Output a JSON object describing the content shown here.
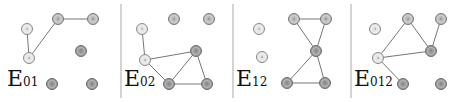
{
  "figure": {
    "panels": [
      {
        "label_main": "E",
        "label_sub": "01",
        "nodes": [
          {
            "id": "3",
            "x": 27,
            "y": 29,
            "shade": "light"
          },
          {
            "id": "2",
            "x": 58,
            "y": 19,
            "shade": "mid"
          },
          {
            "id": "6",
            "x": 93,
            "y": 19,
            "shade": "mid"
          },
          {
            "id": "4",
            "x": 29,
            "y": 58,
            "shade": "light"
          },
          {
            "id": "7",
            "x": 81,
            "y": 51,
            "shade": "dark"
          },
          {
            "id": "1",
            "x": 52,
            "y": 84,
            "shade": "dark"
          },
          {
            "id": "5",
            "x": 92,
            "y": 84,
            "shade": "dark"
          }
        ],
        "edges": [
          [
            "3",
            "4"
          ],
          [
            "4",
            "2"
          ],
          [
            "2",
            "6"
          ]
        ]
      },
      {
        "label_main": "E",
        "label_sub": "02",
        "nodes": [
          {
            "id": "3",
            "x": 142,
            "y": 29,
            "shade": "light"
          },
          {
            "id": "2",
            "x": 174,
            "y": 19,
            "shade": "mid"
          },
          {
            "id": "6",
            "x": 209,
            "y": 19,
            "shade": "mid"
          },
          {
            "id": "4",
            "x": 145,
            "y": 60,
            "shade": "light"
          },
          {
            "id": "7",
            "x": 196,
            "y": 51,
            "shade": "dark"
          },
          {
            "id": "1",
            "x": 169,
            "y": 84,
            "shade": "dark"
          },
          {
            "id": "5",
            "x": 207,
            "y": 84,
            "shade": "dark"
          }
        ],
        "edges": [
          [
            "3",
            "4"
          ],
          [
            "4",
            "7"
          ],
          [
            "4",
            "1"
          ],
          [
            "1",
            "7"
          ],
          [
            "7",
            "5"
          ],
          [
            "1",
            "5"
          ]
        ]
      },
      {
        "label_main": "E",
        "label_sub": "12",
        "nodes": [
          {
            "id": "3",
            "x": 259,
            "y": 29,
            "shade": "light"
          },
          {
            "id": "4",
            "x": 262,
            "y": 57,
            "shade": "light"
          },
          {
            "id": "2",
            "x": 294,
            "y": 19,
            "shade": "mid"
          },
          {
            "id": "6",
            "x": 326,
            "y": 19,
            "shade": "mid"
          },
          {
            "id": "7",
            "x": 316,
            "y": 51,
            "shade": "dark"
          },
          {
            "id": "1",
            "x": 287,
            "y": 83,
            "shade": "dark"
          },
          {
            "id": "5",
            "x": 325,
            "y": 83,
            "shade": "dark"
          }
        ],
        "edges": [
          [
            "2",
            "6"
          ],
          [
            "2",
            "7"
          ],
          [
            "6",
            "7"
          ],
          [
            "7",
            "1"
          ],
          [
            "7",
            "5"
          ],
          [
            "1",
            "5"
          ]
        ]
      },
      {
        "label_main": "E",
        "label_sub": "012",
        "nodes": [
          {
            "id": "3",
            "x": 375,
            "y": 29,
            "shade": "light"
          },
          {
            "id": "2",
            "x": 408,
            "y": 19,
            "shade": "mid"
          },
          {
            "id": "6",
            "x": 441,
            "y": 19,
            "shade": "mid"
          },
          {
            "id": "4",
            "x": 378,
            "y": 58,
            "shade": "light"
          },
          {
            "id": "7",
            "x": 431,
            "y": 51,
            "shade": "dark"
          },
          {
            "id": "1",
            "x": 403,
            "y": 84,
            "shade": "dark"
          },
          {
            "id": "5",
            "x": 441,
            "y": 84,
            "shade": "dark"
          }
        ],
        "edges": [
          [
            "4",
            "2"
          ],
          [
            "2",
            "7"
          ],
          [
            "6",
            "7"
          ],
          [
            "4",
            "7"
          ],
          [
            "4",
            "1"
          ]
        ]
      }
    ],
    "separators_x": [
      121,
      233,
      351
    ],
    "label_positions": [
      {
        "x": 7,
        "y": 68
      },
      {
        "x": 124,
        "y": 68
      },
      {
        "x": 236,
        "y": 68
      },
      {
        "x": 354,
        "y": 68
      }
    ]
  }
}
